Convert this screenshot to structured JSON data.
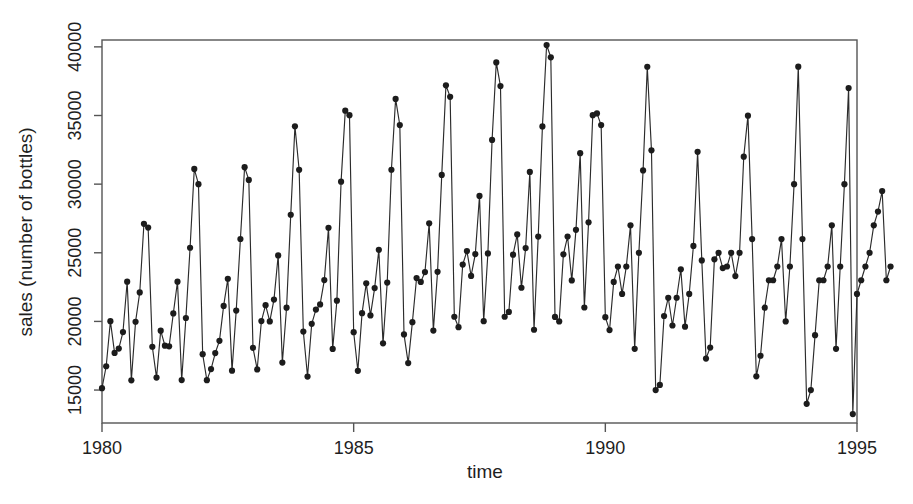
{
  "chart_data": {
    "type": "line",
    "title": "",
    "xlabel": "time",
    "ylabel": "sales (number of bottles)",
    "xlim": [
      1980.0,
      1995.0
    ],
    "ylim": [
      12600,
      40500
    ],
    "grid": false,
    "legend": "none",
    "marker": "filled-circle",
    "line_style": "solid",
    "xticks": [
      1980,
      1985,
      1990,
      1995
    ],
    "xticklabels": [
      "1980",
      "1985",
      "1990",
      "1995"
    ],
    "yticks": [
      15000,
      20000,
      25000,
      30000,
      35000,
      40000
    ],
    "yticklabels": [
      "15000",
      "20000",
      "25000",
      "30000",
      "35000",
      "40000"
    ],
    "series": [
      {
        "name": "sales",
        "x_start": 1980.0,
        "x_step": 0.0833333,
        "values": [
          15136,
          16733,
          20016,
          17708,
          18019,
          19227,
          22893,
          15709,
          19977,
          22111,
          27109,
          26837,
          18153,
          15906,
          19326,
          18232,
          18186,
          20580,
          22893,
          15729,
          20248,
          25368,
          31107,
          29999,
          17610,
          15721,
          16529,
          17696,
          18584,
          21128,
          23107,
          16415,
          20790,
          26005,
          31239,
          30308,
          18077,
          16502,
          20026,
          21182,
          20000,
          21588,
          24804,
          17004,
          21001,
          27770,
          34215,
          31046,
          19262,
          15983,
          19827,
          20861,
          21238,
          23011,
          26822,
          17997,
          21508,
          30183,
          35355,
          35021,
          19215,
          16401,
          20602,
          22772,
          20437,
          22429,
          25215,
          18402,
          22833,
          31048,
          36205,
          34303,
          19055,
          16963,
          19946,
          23158,
          22879,
          23597,
          27149,
          19336,
          23614,
          30674,
          37197,
          36362,
          20341,
          19577,
          24142,
          25124,
          23312,
          24905,
          29140,
          20015,
          24950,
          33220,
          38863,
          37144,
          20339,
          20689,
          24862,
          26337,
          22452,
          25339,
          30891,
          19393,
          26179,
          34205,
          40136,
          39241,
          20326,
          19996,
          24886,
          26184,
          22984,
          26669,
          32257,
          21015,
          27220,
          35022,
          35151,
          34299,
          20310,
          19367,
          22879,
          24000,
          22000,
          24000,
          27000,
          18000,
          25000,
          31000,
          38552,
          32461,
          14997,
          15370,
          20393,
          21725,
          19704,
          21723,
          23798,
          19620,
          22000,
          25500,
          32352,
          24442,
          17294,
          18096,
          24521,
          25000,
          23888,
          24000,
          25000,
          23300,
          25000,
          32000,
          34990,
          26000,
          16000,
          17500,
          21000,
          23000,
          23000,
          24000,
          26000,
          20000,
          24000,
          30000,
          38560,
          26000,
          14000,
          15000,
          19000,
          23000,
          23000,
          24000,
          27000,
          18000,
          24000,
          30000,
          37000,
          13252,
          22000,
          23000,
          24000,
          25000,
          27000,
          28000,
          29500,
          23000,
          24000
        ]
      }
    ]
  },
  "axes": {
    "x_title": "time",
    "y_title": "sales (number of bottles)"
  }
}
